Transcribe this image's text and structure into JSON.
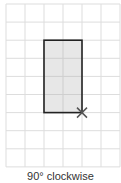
{
  "diagram": {
    "caption": "90° clockwise",
    "grid": {
      "columns": 6,
      "rows": 9,
      "origin_x": 6,
      "origin_y": 4,
      "cell_w": 19,
      "cell_h": 181,
      "line_color": "#dddddd"
    },
    "shape": {
      "type": "rectangle",
      "col_start": 2,
      "row_start": 2,
      "col_span": 2,
      "row_span": 4,
      "fill": "#e3e3e3",
      "stroke": "#222222"
    },
    "pivot_marker": {
      "symbol": "×",
      "col": 4,
      "row": 6,
      "color": "#555555"
    }
  }
}
